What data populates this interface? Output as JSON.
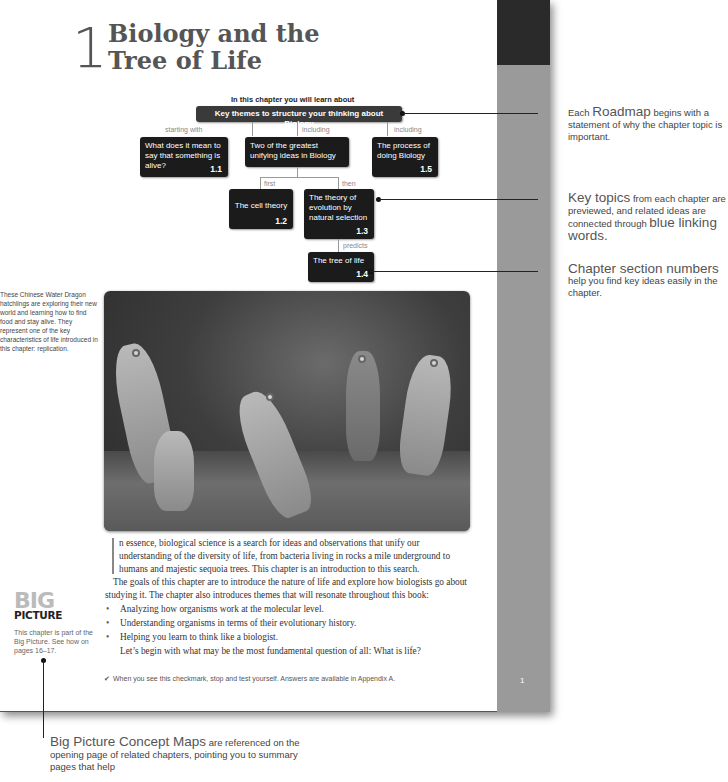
{
  "page": {
    "chapter_number": "1",
    "chapter_title_line1": "Biology and the",
    "chapter_title_line2": "Tree of Life",
    "page_number": "1"
  },
  "roadmap": {
    "intro": "In this chapter you will learn about",
    "main": "Key themes to structure your thinking about Biology",
    "links": {
      "starting_with": "starting with",
      "including_1": "including",
      "including_2": "including",
      "first": "first",
      "then": "then",
      "predicts": "predicts"
    },
    "boxes": [
      {
        "text": "What does it mean to say that something is alive?",
        "num": "1.1"
      },
      {
        "text": "Two of the greatest unifying ideas in Biology",
        "num": ""
      },
      {
        "text": "The process of doing Biology",
        "num": "1.5"
      },
      {
        "text": "The cell theory",
        "num": "1.2"
      },
      {
        "text": "The theory of evolution by natural selection",
        "num": "1.3"
      },
      {
        "text": "The tree of life",
        "num": "1.4"
      }
    ]
  },
  "annotations": {
    "roadmap_big": "Roadmap",
    "roadmap_pre": "Each ",
    "roadmap_post": " begins with a statement of why the chapter topic is important.",
    "keytopics_big": "Key topics",
    "keytopics_mid": " from each chapter are previewed, and related ideas are connected through ",
    "keytopics_big2": "blue linking words.",
    "sections_big": "Chapter section numbers",
    "sections_post": "help you find key ideas easily in the chapter.",
    "bigpicture_big": "Big Picture Concept Maps",
    "bigpicture_post": " are referenced on the opening page of related chapters, pointing you to summary pages that help"
  },
  "photo": {
    "caption": "These Chinese Water Dragon hatchlings are exploring their new world and learning how to find food and stay alive. They represent one of the key characteristics of life introduced in this chapter: replication.",
    "alt": "Chinese Water Dragon hatchlings"
  },
  "body": {
    "para1": "n essence, biological science is a search for ideas and observations that unify our understanding of the diversity of life, from bacteria living in rocks a mile underground to humans and majestic sequoia trees. This chapter is an introduction to this search.",
    "para2": "The goals of this chapter are to introduce the nature of life and explore how biologists go about studying it. The chapter also introduces themes that will resonate throughout this book:",
    "bullets": [
      "Analyzing how organisms work at the molecular level.",
      "Understanding organisms in terms of their evolutionary history.",
      "Helping you learn to think like a biologist."
    ],
    "para3": "Let’s begin with what may be the most fundamental question of all: What is life?"
  },
  "checkmark_note": "When you see this checkmark, stop and test yourself. Answers are available in Appendix A.",
  "big_picture": {
    "logo_top": "BIG",
    "logo_bottom": "PICTURE",
    "note": "This chapter is part of the Big Picture. See how on pages 16–17."
  },
  "colors": {
    "band_gray": "#9a9a9a",
    "band_dark": "#2a2a2a",
    "box_dark": "#1b1b1b"
  }
}
